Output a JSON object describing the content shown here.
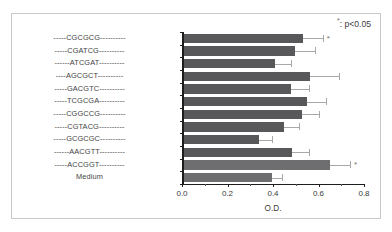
{
  "figure": {
    "legend_star": "*",
    "legend_text": ": p<0.05",
    "axis_title": "O.D."
  },
  "chart_data": {
    "type": "bar",
    "orientation": "horizontal",
    "title": "",
    "xlabel": "O.D.",
    "ylabel": "",
    "xlim": [
      0.0,
      0.8
    ],
    "xticks": [
      0.0,
      0.2,
      0.4,
      0.6,
      0.8
    ],
    "xtick_labels": [
      "0.0",
      "0.2",
      "0.4",
      "0.6",
      "0.8"
    ],
    "grid": false,
    "legend": "*: p<0.05",
    "legend_position": "top-right",
    "bar_color": "#58585a",
    "bar_color_alt": "#6e6e70",
    "error_color": "#a8a8a8",
    "categories": [
      "-----CGCGCG----------",
      "-----CGATCG----------",
      "------ATCGAT----------",
      "----AGCGCT----------",
      "-----GACGTC----------",
      "-----TCGCGA----------",
      "-----CGGCCG----------",
      "-----CGTACG----------",
      "-----GCGCGC----------",
      "------AACGTT----------",
      "-----ACCGGT----------",
      "Medium"
    ],
    "sequences": [
      "CGCGCG",
      "CGATCG",
      "ATCGAT",
      "AGCGCT",
      "GACGTC",
      "TCGCGA",
      "CGGCCG",
      "CGTACG",
      "GCGCGC",
      "AACGTT",
      "ACCGGT",
      "Medium"
    ],
    "values": [
      0.525,
      0.49,
      0.4,
      0.555,
      0.47,
      0.54,
      0.52,
      0.44,
      0.33,
      0.475,
      0.64,
      0.385
    ],
    "errors": [
      0.085,
      0.085,
      0.07,
      0.125,
      0.08,
      0.085,
      0.075,
      0.065,
      0.055,
      0.075,
      0.09,
      0.045
    ],
    "significant": [
      true,
      false,
      false,
      false,
      false,
      false,
      false,
      false,
      false,
      false,
      true,
      false
    ],
    "shade_index": [
      0,
      0,
      0,
      0,
      0,
      0,
      0,
      0,
      0,
      0,
      1,
      1
    ]
  }
}
